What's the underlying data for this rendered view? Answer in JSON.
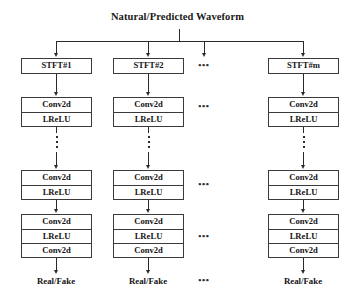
{
  "figure": {
    "type": "block-diagram",
    "title": "Natural/Predicted Waveform"
  },
  "root": {
    "label": "Natural/Predicted Waveform"
  },
  "ellipsis": {
    "horizontal": "•••",
    "vertical_dot_count": 3
  },
  "branches": [
    {
      "id": "branch-1",
      "stft": {
        "label": "STFT#1"
      },
      "block_top": {
        "rows": [
          "Conv2d",
          "LReLU"
        ]
      },
      "block_mid": {
        "rows": [
          "Conv2d",
          "LReLU"
        ]
      },
      "block_bottom": {
        "rows": [
          "Conv2d",
          "LReLU",
          "Conv2d"
        ]
      },
      "output": {
        "label": "Real/Fake"
      }
    },
    {
      "id": "branch-2",
      "stft": {
        "label": "STFT#2"
      },
      "block_top": {
        "rows": [
          "Conv2d",
          "LReLU"
        ]
      },
      "block_mid": {
        "rows": [
          "Conv2d",
          "LReLU"
        ]
      },
      "block_bottom": {
        "rows": [
          "Conv2d",
          "LReLU",
          "Conv2d"
        ]
      },
      "output": {
        "label": "Real/Fake"
      }
    },
    {
      "id": "branch-ellipsis",
      "stft": {
        "label": "•••"
      },
      "block_top": {
        "rows": [
          "•••"
        ]
      },
      "block_mid": {
        "rows": [
          "•••"
        ]
      },
      "block_bottom": {
        "rows": [
          "•••"
        ]
      },
      "output": {
        "label": "•••"
      }
    },
    {
      "id": "branch-m",
      "stft": {
        "label": "STFT#m"
      },
      "block_top": {
        "rows": [
          "Conv2d",
          "LReLU"
        ]
      },
      "block_mid": {
        "rows": [
          "Conv2d",
          "LReLU"
        ]
      },
      "block_bottom": {
        "rows": [
          "Conv2d",
          "LReLU",
          "Conv2d"
        ]
      },
      "output": {
        "label": "Real/Fake"
      }
    }
  ],
  "colors": {
    "background": "#ffffff",
    "line": "#2a2a2a",
    "box_border": "#3a3a3a",
    "text": "#141414"
  }
}
